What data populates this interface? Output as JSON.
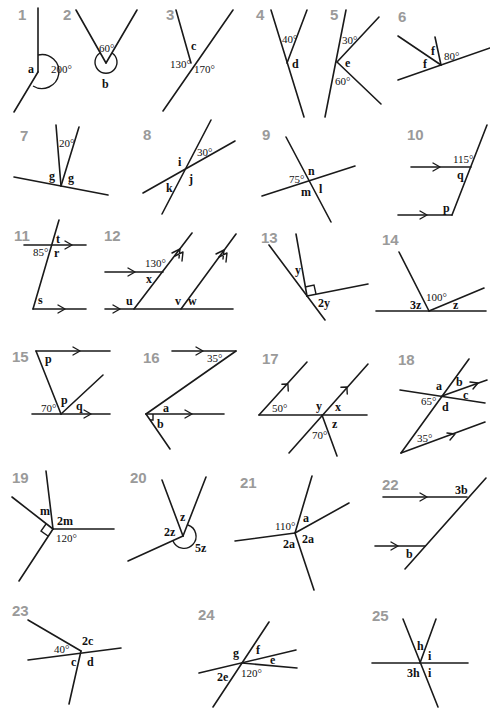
{
  "problems": [
    {
      "n": "1",
      "labels": {
        "a": "a",
        "v1": "200°"
      }
    },
    {
      "n": "2",
      "labels": {
        "v1": "60°",
        "b": "b"
      }
    },
    {
      "n": "3",
      "labels": {
        "c": "c",
        "v1": "130°",
        "v2": "170°"
      }
    },
    {
      "n": "4",
      "labels": {
        "v1": "40°",
        "d": "d"
      }
    },
    {
      "n": "5",
      "labels": {
        "v1": "30°",
        "e": "e",
        "v2": "60°"
      }
    },
    {
      "n": "6",
      "labels": {
        "f1": "f",
        "f2": "f",
        "v1": "80°"
      }
    },
    {
      "n": "7",
      "labels": {
        "v1": "20°",
        "g1": "g",
        "g2": "g"
      }
    },
    {
      "n": "8",
      "labels": {
        "i": "i",
        "v1": "30°",
        "j": "j",
        "k": "k"
      }
    },
    {
      "n": "9",
      "labels": {
        "v1": "75°",
        "n": "n",
        "m": "m",
        "l": "l"
      }
    },
    {
      "n": "10",
      "labels": {
        "v1": "115°",
        "q": "q",
        "p": "p"
      }
    },
    {
      "n": "11",
      "labels": {
        "t": "t",
        "v1": "85°",
        "r": "r",
        "s": "s"
      }
    },
    {
      "n": "12",
      "labels": {
        "v1": "130°",
        "x": "x",
        "u": "u",
        "v": "v",
        "w": "w"
      }
    },
    {
      "n": "13",
      "labels": {
        "y": "y",
        "y2": "2y"
      }
    },
    {
      "n": "14",
      "labels": {
        "z3": "3z",
        "v1": "100°",
        "z": "z"
      }
    },
    {
      "n": "15",
      "labels": {
        "p1": "p",
        "p2": "p",
        "v1": "70°",
        "q": "q"
      }
    },
    {
      "n": "16",
      "labels": {
        "v1": "35°",
        "a": "a",
        "b": "b"
      }
    },
    {
      "n": "17",
      "labels": {
        "v1": "50°",
        "y": "y",
        "x": "x",
        "z": "z",
        "v2": "70°"
      }
    },
    {
      "n": "18",
      "labels": {
        "a": "a",
        "b": "b",
        "c": "c",
        "v1": "65°",
        "d": "d",
        "v2": "35°"
      }
    },
    {
      "n": "19",
      "labels": {
        "m": "m",
        "m2": "2m",
        "v1": "120°"
      }
    },
    {
      "n": "20",
      "labels": {
        "z": "z",
        "z2": "2z",
        "z5": "5z"
      }
    },
    {
      "n": "21",
      "labels": {
        "v1": "110°",
        "a": "a",
        "a2l": "2a",
        "a2r": "2a"
      }
    },
    {
      "n": "22",
      "labels": {
        "b3": "3b",
        "b": "b"
      }
    },
    {
      "n": "23",
      "labels": {
        "v1": "40°",
        "c2": "2c",
        "c": "c",
        "d": "d"
      }
    },
    {
      "n": "24",
      "labels": {
        "g": "g",
        "f": "f",
        "e": "e",
        "e2": "2e",
        "v1": "120°"
      }
    },
    {
      "n": "25",
      "labels": {
        "h": "h",
        "i1": "i",
        "h3": "3h",
        "i2": "i"
      }
    }
  ]
}
